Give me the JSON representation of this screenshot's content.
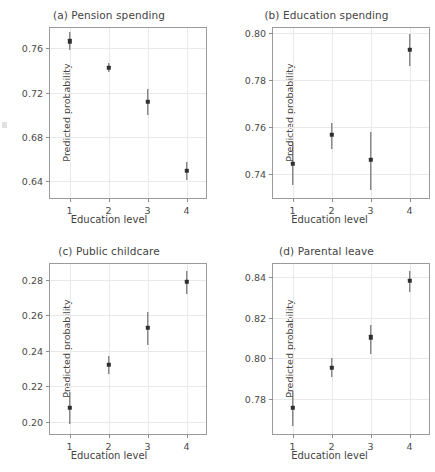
{
  "figure": {
    "panel_count": 4,
    "shared_xlabel": "Education level",
    "shared_ylabel": "Predicted probability"
  },
  "panels": [
    {
      "id": "a",
      "title": "(a) Pension spending",
      "xlabel": "Education level",
      "ylabel": "Predicted probability",
      "xticklabels": [
        "1",
        "2",
        "3",
        "4"
      ],
      "yticklabels": [
        "0.64",
        "0.68",
        "0.72",
        "0.76"
      ]
    },
    {
      "id": "b",
      "title": "(b) Education spending",
      "xlabel": "Education level",
      "ylabel": "Predicted probability",
      "xticklabels": [
        "1",
        "2",
        "3",
        "4"
      ],
      "yticklabels": [
        "0.74",
        "0.76",
        "0.78",
        "0.80"
      ]
    },
    {
      "id": "c",
      "title": "(c) Public childcare",
      "xlabel": "Education level",
      "ylabel": "Predicted probability",
      "xticklabels": [
        "1",
        "2",
        "3",
        "4"
      ],
      "yticklabels": [
        "0.20",
        "0.22",
        "0.24",
        "0.26",
        "0.28"
      ]
    },
    {
      "id": "d",
      "title": "(d) Parental leave",
      "xlabel": "Education level",
      "ylabel": "Predicted probability",
      "xticklabels": [
        "1",
        "2",
        "3",
        "4"
      ],
      "yticklabels": [
        "0.78",
        "0.80",
        "0.82",
        "0.84"
      ]
    }
  ],
  "chart_data": [
    {
      "type": "scatter",
      "panel": "a",
      "title": "(a) Pension spending",
      "xlabel": "Education level",
      "ylabel": "Predicted probability",
      "x": [
        1,
        2,
        3,
        4
      ],
      "xticklabels": [
        "1",
        "2",
        "3",
        "4"
      ],
      "values": [
        0.7665,
        0.7425,
        0.7115,
        0.649
      ],
      "ci_low": [
        0.7585,
        0.7385,
        0.6995,
        0.641
      ],
      "ci_high": [
        0.7745,
        0.747,
        0.723,
        0.6575
      ],
      "errorbars": true,
      "xlim": [
        0.5,
        4.5
      ],
      "ylim": [
        0.6245,
        0.7785
      ],
      "yticks": [
        0.64,
        0.68,
        0.72,
        0.76
      ],
      "yticklabels": [
        "0.64",
        "0.68",
        "0.72",
        "0.76"
      ],
      "grid": true,
      "legend": false
    },
    {
      "type": "scatter",
      "panel": "b",
      "title": "(b) Education spending",
      "xlabel": "Education level",
      "ylabel": "Predicted probability",
      "x": [
        1,
        2,
        3,
        4
      ],
      "xticklabels": [
        "1",
        "2",
        "3",
        "4"
      ],
      "values": [
        0.7443,
        0.7567,
        0.746,
        0.7928
      ],
      "ci_low": [
        0.7353,
        0.7508,
        0.7332,
        0.786
      ],
      "ci_high": [
        0.7537,
        0.7617,
        0.758,
        0.7997
      ],
      "errorbars": true,
      "xlim": [
        0.5,
        4.5
      ],
      "ylim": [
        0.7297,
        0.8022
      ],
      "yticks": [
        0.74,
        0.76,
        0.78,
        0.8
      ],
      "yticklabels": [
        "0.74",
        "0.76",
        "0.78",
        "0.80"
      ],
      "grid": true,
      "legend": false
    },
    {
      "type": "scatter",
      "panel": "c",
      "title": "(c) Public childcare",
      "xlabel": "Education level",
      "ylabel": "Predicted probability",
      "x": [
        1,
        2,
        3,
        4
      ],
      "xticklabels": [
        "1",
        "2",
        "3",
        "4"
      ],
      "values": [
        0.2078,
        0.2322,
        0.2528,
        0.2788
      ],
      "ci_low": [
        0.1988,
        0.2268,
        0.2435,
        0.2718
      ],
      "ci_high": [
        0.217,
        0.2372,
        0.2618,
        0.2852
      ],
      "errorbars": true,
      "xlim": [
        0.5,
        4.5
      ],
      "ylim": [
        0.193,
        0.289
      ],
      "yticks": [
        0.2,
        0.22,
        0.24,
        0.26,
        0.28
      ],
      "yticklabels": [
        "0.20",
        "0.22",
        "0.24",
        "0.26",
        "0.28"
      ],
      "grid": true,
      "legend": false
    },
    {
      "type": "scatter",
      "panel": "d",
      "title": "(d) Parental leave",
      "xlabel": "Education level",
      "ylabel": "Predicted probability",
      "x": [
        1,
        2,
        3,
        4
      ],
      "xticklabels": [
        "1",
        "2",
        "3",
        "4"
      ],
      "values": [
        0.7755,
        0.7952,
        0.8102,
        0.8382
      ],
      "ci_low": [
        0.7665,
        0.7908,
        0.8018,
        0.8325
      ],
      "ci_high": [
        0.7838,
        0.8,
        0.8165,
        0.8432
      ],
      "errorbars": true,
      "xlim": [
        0.5,
        4.5
      ],
      "ylim": [
        0.7625,
        0.8465
      ],
      "yticks": [
        0.78,
        0.8,
        0.82,
        0.84
      ],
      "yticklabels": [
        "0.78",
        "0.80",
        "0.82",
        "0.84"
      ],
      "grid": true,
      "legend": false
    }
  ],
  "colors": {
    "marker": "#2f2f2f",
    "errorbar": "#555555",
    "grid": "#e9e9e9",
    "frame": "#9b9b9b",
    "text": "#444444",
    "background": "#ffffff"
  }
}
